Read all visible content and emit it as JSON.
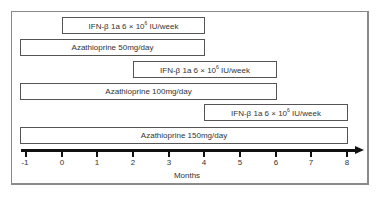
{
  "diagram": {
    "type": "treatment-timeline",
    "x_axis": {
      "label": "Months",
      "ticks": [
        "-1",
        "0",
        "1",
        "2",
        "3",
        "4",
        "5",
        "6",
        "7",
        "8"
      ],
      "range": [
        -1,
        8
      ]
    },
    "bars": [
      {
        "label_main": "IFN-β 1a 6 × 10",
        "label_sup": "6",
        "label_tail": " IU/week",
        "start": 0,
        "end": 4
      },
      {
        "label": "Azathioprine 50mg/day",
        "start": -1,
        "end": 4
      },
      {
        "label_main": "IFN-β 1a 6 × 10",
        "label_sup": "6",
        "label_tail": " IU/week",
        "start": 2,
        "end": 6
      },
      {
        "label": "Azathioprine 100mg/day",
        "start": -1,
        "end": 6
      },
      {
        "label_main": "IFN-β 1a 6 × 10",
        "label_sup": "6",
        "label_tail": " IU/week",
        "start": 4,
        "end": 8
      },
      {
        "label": "Azathioprine 150mg/day",
        "start": -1,
        "end": 8
      }
    ]
  }
}
